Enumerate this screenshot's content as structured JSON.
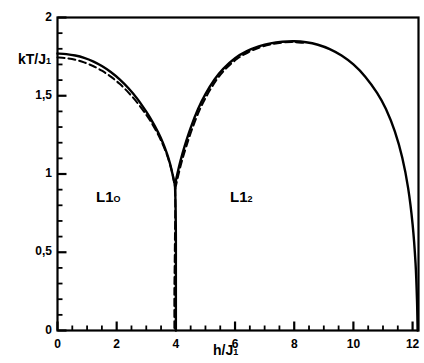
{
  "figure": {
    "kind": "phase-diagram",
    "background_color": "#ffffff",
    "line_color": "#000000"
  },
  "axes": {
    "ylabel": "kT/J",
    "ylabel_sub": "1",
    "xlabel": "h/J",
    "xlabel_sub": "1",
    "xticklabels": [
      "0",
      "2",
      "4",
      "6",
      "8",
      "10",
      "12"
    ],
    "yticklabels": [
      "0",
      "0,5",
      "1",
      "1,5",
      "2"
    ]
  },
  "annotations": {
    "phase_left": "L1",
    "phase_left_sub": "O",
    "phase_right": "L1",
    "phase_right_sub": "2"
  },
  "chart_data": {
    "type": "line",
    "title": "",
    "xlabel": "h/J_1",
    "ylabel": "kT/J_1",
    "xlim": [
      0,
      12.2
    ],
    "ylim": [
      0,
      2
    ],
    "xticks": [
      0,
      2,
      4,
      6,
      8,
      10,
      12
    ],
    "yticks": [
      0,
      0.5,
      1,
      1.5,
      2
    ],
    "xminorticks": 0.5,
    "yminorticks": 0.1,
    "grid": false,
    "legend": false,
    "frame": "box",
    "annotations": [
      {
        "text": "L1_O",
        "x": 2.1,
        "y": 0.72
      },
      {
        "text": "L1_2",
        "x": 6.4,
        "y": 0.72
      }
    ],
    "series": [
      {
        "name": "solid-L10-boundary",
        "style": "solid",
        "points": [
          [
            0.0,
            1.77
          ],
          [
            0.3,
            1.766
          ],
          [
            0.6,
            1.757
          ],
          [
            0.9,
            1.742
          ],
          [
            1.2,
            1.72
          ],
          [
            1.5,
            1.69
          ],
          [
            1.8,
            1.652
          ],
          [
            2.1,
            1.605
          ],
          [
            2.4,
            1.548
          ],
          [
            2.7,
            1.48
          ],
          [
            3.0,
            1.398
          ],
          [
            3.2,
            1.336
          ],
          [
            3.4,
            1.266
          ],
          [
            3.55,
            1.204
          ],
          [
            3.7,
            1.13
          ],
          [
            3.8,
            1.068
          ],
          [
            3.88,
            1.005
          ],
          [
            3.93,
            0.96
          ],
          [
            3.97,
            0.93
          ]
        ]
      },
      {
        "name": "solid-vertical-first-order",
        "style": "solid",
        "points": [
          [
            3.97,
            0.93
          ],
          [
            3.99,
            0.8
          ],
          [
            4.0,
            0.6
          ],
          [
            4.0,
            0.4
          ],
          [
            4.0,
            0.2
          ],
          [
            4.0,
            0.0
          ]
        ]
      },
      {
        "name": "solid-L12-boundary",
        "style": "solid",
        "points": [
          [
            3.97,
            0.93
          ],
          [
            4.05,
            1.0
          ],
          [
            4.15,
            1.08
          ],
          [
            4.3,
            1.18
          ],
          [
            4.5,
            1.295
          ],
          [
            4.75,
            1.415
          ],
          [
            5.0,
            1.51
          ],
          [
            5.3,
            1.602
          ],
          [
            5.6,
            1.672
          ],
          [
            6.0,
            1.74
          ],
          [
            6.4,
            1.785
          ],
          [
            6.8,
            1.815
          ],
          [
            7.2,
            1.835
          ],
          [
            7.6,
            1.845
          ],
          [
            8.0,
            1.848
          ],
          [
            8.4,
            1.842
          ],
          [
            8.8,
            1.826
          ],
          [
            9.2,
            1.798
          ],
          [
            9.6,
            1.757
          ],
          [
            10.0,
            1.7
          ],
          [
            10.4,
            1.622
          ],
          [
            10.8,
            1.518
          ],
          [
            11.1,
            1.415
          ],
          [
            11.4,
            1.272
          ],
          [
            11.65,
            1.105
          ],
          [
            11.85,
            0.91
          ],
          [
            12.0,
            0.68
          ],
          [
            12.1,
            0.43
          ],
          [
            12.15,
            0.19
          ],
          [
            12.17,
            0.0
          ]
        ]
      },
      {
        "name": "dashed-L10-boundary",
        "style": "dashed",
        "points": [
          [
            0.0,
            1.745
          ],
          [
            0.3,
            1.74
          ],
          [
            0.6,
            1.73
          ],
          [
            0.9,
            1.713
          ],
          [
            1.2,
            1.69
          ],
          [
            1.5,
            1.66
          ],
          [
            1.8,
            1.622
          ],
          [
            2.1,
            1.576
          ],
          [
            2.4,
            1.52
          ],
          [
            2.7,
            1.455
          ],
          [
            3.0,
            1.378
          ],
          [
            3.2,
            1.32
          ],
          [
            3.4,
            1.252
          ],
          [
            3.55,
            1.192
          ],
          [
            3.7,
            1.122
          ],
          [
            3.82,
            1.05
          ],
          [
            3.9,
            0.99
          ],
          [
            3.95,
            0.94
          ],
          [
            3.98,
            0.905
          ]
        ]
      },
      {
        "name": "dashed-vertical-first-order",
        "style": "dashed",
        "points": [
          [
            3.98,
            0.905
          ],
          [
            3.98,
            0.78
          ],
          [
            3.97,
            0.6
          ],
          [
            3.96,
            0.42
          ],
          [
            3.95,
            0.25
          ],
          [
            3.95,
            0.09
          ],
          [
            3.95,
            0.0
          ]
        ]
      },
      {
        "name": "dashed-L12-boundary",
        "style": "dashed",
        "points": [
          [
            3.98,
            0.905
          ],
          [
            4.08,
            0.99
          ],
          [
            4.2,
            1.08
          ],
          [
            4.35,
            1.175
          ],
          [
            4.55,
            1.288
          ],
          [
            4.8,
            1.408
          ],
          [
            5.05,
            1.502
          ],
          [
            5.35,
            1.595
          ],
          [
            5.65,
            1.665
          ],
          [
            6.05,
            1.733
          ],
          [
            6.45,
            1.778
          ],
          [
            6.85,
            1.81
          ],
          [
            7.25,
            1.83
          ],
          [
            7.65,
            1.841
          ],
          [
            8.0,
            1.843
          ],
          [
            8.3,
            1.838
          ]
        ]
      }
    ]
  }
}
